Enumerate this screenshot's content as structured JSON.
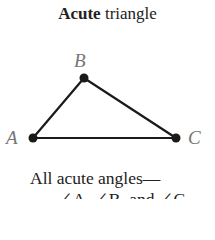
{
  "title": {
    "bold": "Acute",
    "rest": " triangle"
  },
  "vertices": [
    {
      "label": "A",
      "x": 33,
      "y": 138
    },
    {
      "label": "B",
      "x": 84,
      "y": 78
    },
    {
      "label": "C",
      "x": 176,
      "y": 138
    }
  ],
  "caption": {
    "line1": "All acute angles—",
    "line2": "∠A, ∠B, and ∠C"
  },
  "colors": {
    "line": "#1a1a1a",
    "label": "#777777",
    "text": "#222222"
  }
}
